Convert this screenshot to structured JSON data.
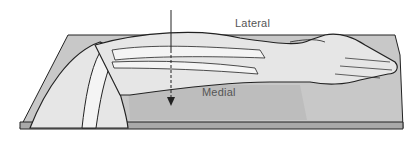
{
  "figure": {
    "labels": {
      "lateral": "Lateral",
      "medial": "Medial"
    },
    "colors": {
      "cassette": "#c8c8c8",
      "cassette_edge": "#a9a9a9",
      "skin": "#e6e6e6",
      "bone": "#f4f4f4",
      "outline": "#222222"
    },
    "beam": {
      "direction": "down",
      "icon": "arrow-down-icon"
    }
  }
}
